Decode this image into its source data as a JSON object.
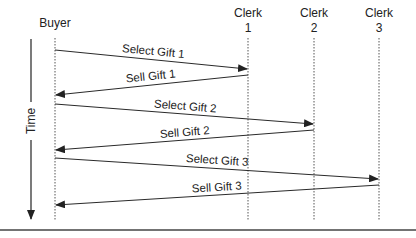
{
  "diagram": {
    "type": "sequence",
    "colors": {
      "line": "#2a2a2a",
      "lifeline": "#555555",
      "text": "#222222",
      "background": "#ffffff"
    },
    "time_axis": {
      "label": "Time",
      "icon": "arrow-down-icon"
    },
    "actors": [
      {
        "id": "buyer",
        "line1": "Buyer",
        "line2": ""
      },
      {
        "id": "clerk1",
        "line1": "Clerk",
        "line2": "1"
      },
      {
        "id": "clerk2",
        "line1": "Clerk",
        "line2": "2"
      },
      {
        "id": "clerk3",
        "line1": "Clerk",
        "line2": "3"
      }
    ],
    "messages": [
      {
        "label": "Select Gift 1",
        "from": "Buyer",
        "to": "Clerk 1"
      },
      {
        "label": "Sell Gift 1",
        "from": "Clerk 1",
        "to": "Buyer"
      },
      {
        "label": "Select Gift 2",
        "from": "Buyer",
        "to": "Clerk 2"
      },
      {
        "label": "Sell Gift 2",
        "from": "Clerk 2",
        "to": "Buyer"
      },
      {
        "label": "Select Gift 3",
        "from": "Buyer",
        "to": "Clerk 3"
      },
      {
        "label": "Sell Gift 3",
        "from": "Clerk 3",
        "to": "Buyer"
      }
    ]
  }
}
